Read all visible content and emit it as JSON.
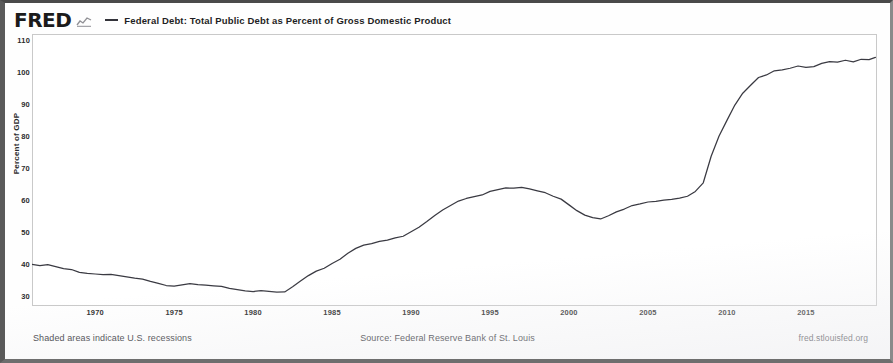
{
  "header": {
    "logo_text": "FRED",
    "logo_mark_icon": "mini-line-chart-icon",
    "legend_marker_icon": "legend-line-icon",
    "legend_label": "Federal Debt: Total Public Debt as Percent of Gross Domestic Product"
  },
  "footer": {
    "recession_note": "Shaded areas indicate U.S. recessions",
    "source": "Source: Federal Reserve Bank of St. Louis",
    "url": "fred.stlouisfed.org"
  },
  "colors": {
    "line": "#3a3a42",
    "axis_text": "#2c2c2c",
    "plot_border": "#c9c9c9",
    "background": "#fefefe"
  },
  "chart_data": {
    "type": "line",
    "title": "Federal Debt: Total Public Debt as Percent of Gross Domestic Product",
    "xlabel": "",
    "ylabel": "Percent of GDP",
    "xlim": [
      1966,
      2019.5
    ],
    "ylim": [
      27,
      112
    ],
    "yticks": [
      110,
      100,
      90,
      80,
      70,
      60,
      50,
      40,
      30
    ],
    "xticks": [
      1970,
      1975,
      1980,
      1985,
      1990,
      1995,
      2000,
      2005,
      2010,
      2015
    ],
    "grid": false,
    "legend_position": "top",
    "series": [
      {
        "name": "Federal Debt: Total Public Debt as Percent of Gross Domestic Product",
        "color": "#3a3a42",
        "x": [
          1966.0,
          1966.5,
          1967.0,
          1967.5,
          1968.0,
          1968.5,
          1969.0,
          1969.5,
          1970.0,
          1970.5,
          1971.0,
          1971.5,
          1972.0,
          1972.5,
          1973.0,
          1973.5,
          1974.0,
          1974.5,
          1975.0,
          1975.5,
          1976.0,
          1976.5,
          1977.0,
          1977.5,
          1978.0,
          1978.5,
          1979.0,
          1979.5,
          1980.0,
          1980.5,
          1981.0,
          1981.5,
          1982.0,
          1982.5,
          1983.0,
          1983.5,
          1984.0,
          1984.5,
          1985.0,
          1985.5,
          1986.0,
          1986.5,
          1987.0,
          1987.5,
          1988.0,
          1988.5,
          1989.0,
          1989.5,
          1990.0,
          1990.5,
          1991.0,
          1991.5,
          1992.0,
          1992.5,
          1993.0,
          1993.5,
          1994.0,
          1994.5,
          1995.0,
          1995.5,
          1996.0,
          1996.5,
          1997.0,
          1997.5,
          1998.0,
          1998.5,
          1999.0,
          1999.5,
          2000.0,
          2000.5,
          2001.0,
          2001.5,
          2002.0,
          2002.5,
          2003.0,
          2003.5,
          2004.0,
          2004.5,
          2005.0,
          2005.5,
          2006.0,
          2006.5,
          2007.0,
          2007.5,
          2008.0,
          2008.5,
          2009.0,
          2009.5,
          2010.0,
          2010.5,
          2011.0,
          2011.5,
          2012.0,
          2012.5,
          2013.0,
          2013.5,
          2014.0,
          2014.5,
          2015.0,
          2015.5,
          2016.0,
          2016.5,
          2017.0,
          2017.5,
          2018.0,
          2018.5,
          2019.0,
          2019.4
        ],
        "y": [
          40.0,
          39.6,
          39.9,
          39.3,
          38.7,
          38.4,
          37.5,
          37.2,
          37.0,
          36.8,
          36.9,
          36.5,
          36.1,
          35.7,
          35.4,
          34.7,
          34.1,
          33.4,
          33.2,
          33.6,
          34.0,
          33.7,
          33.5,
          33.3,
          33.1,
          32.5,
          32.1,
          31.7,
          31.5,
          31.8,
          31.6,
          31.3,
          31.4,
          33.0,
          34.8,
          36.5,
          37.9,
          38.8,
          40.3,
          41.6,
          43.5,
          45.0,
          46.0,
          46.5,
          47.2,
          47.6,
          48.3,
          48.8,
          50.2,
          51.6,
          53.4,
          55.3,
          57.0,
          58.4,
          59.8,
          60.6,
          61.2,
          61.7,
          62.8,
          63.4,
          63.9,
          63.8,
          64.1,
          63.6,
          63.0,
          62.4,
          61.3,
          60.4,
          58.6,
          56.8,
          55.4,
          54.6,
          54.2,
          55.2,
          56.4,
          57.3,
          58.4,
          58.9,
          59.5,
          59.7,
          60.1,
          60.3,
          60.7,
          61.3,
          62.8,
          65.5,
          73.8,
          80.1,
          85.0,
          89.8,
          93.5,
          96.0,
          98.4,
          99.2,
          100.5,
          100.8,
          101.3,
          102.0,
          101.6,
          101.8,
          102.8,
          103.4,
          103.2,
          103.8,
          103.3,
          104.1,
          104.0,
          104.7
        ]
      }
    ]
  }
}
